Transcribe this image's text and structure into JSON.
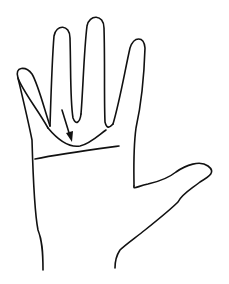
{
  "diagram": {
    "view": "palm, fingers raised",
    "elements": [
      {
        "name": "hand-outline",
        "description": "Outline of an open hand with four fingers and thumb"
      },
      {
        "name": "girdle-curve",
        "description": "Curved line below the middle and ring fingers"
      },
      {
        "name": "palm-crease-line",
        "description": "Straight horizontal line across the upper palm"
      },
      {
        "name": "arrow",
        "description": "Arrow pointing to the curved line"
      }
    ],
    "colors": {
      "stroke": "#111111",
      "background": "#ffffff"
    }
  }
}
